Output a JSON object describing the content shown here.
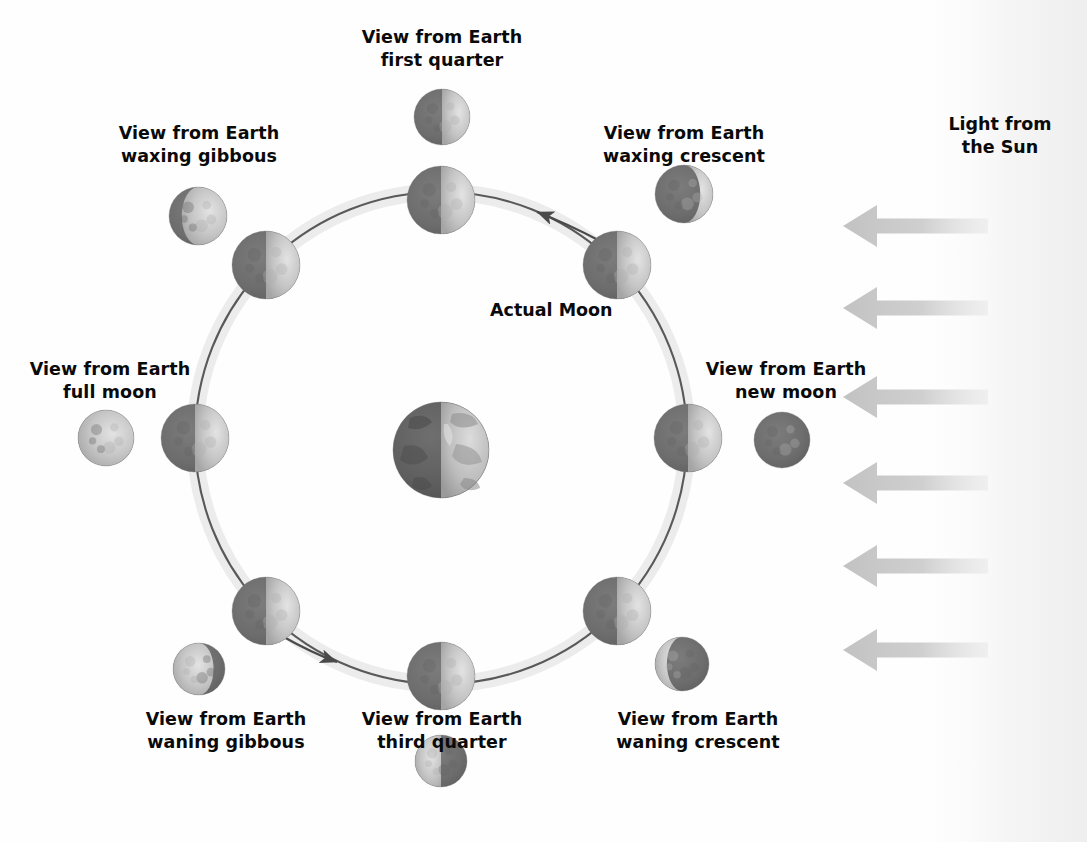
{
  "diagram": {
    "background_color": "#fefefe",
    "text_color": "#0a0a0a",
    "orbit_band_color": "#ebebeb",
    "orbit_line_color": "#4a4a4a",
    "sun_arrow_color": "#c9c9c9",
    "sun_glow_color": "#f1f1f1",
    "moon_lit_color": "#c8c8c8",
    "moon_dark_color": "#6e6e6e",
    "earth_lit_color": "#c4c4c4",
    "earth_dark_color": "#5f5f5f"
  },
  "center_label": {
    "actual_moon": "Actual Moon"
  },
  "sun": {
    "label": "Light from\nthe Sun",
    "direction": "right-to-left",
    "arrow_count": 6,
    "arrows": [
      {
        "y": 226,
        "tip_x": 843,
        "tail_x": 988
      },
      {
        "y": 308,
        "tip_x": 843,
        "tail_x": 988
      },
      {
        "y": 397,
        "tip_x": 843,
        "tail_x": 988
      },
      {
        "y": 483,
        "tip_x": 843,
        "tail_x": 988
      },
      {
        "y": 566,
        "tip_x": 843,
        "tail_x": 988
      },
      {
        "y": 650,
        "tip_x": 843,
        "tail_x": 988
      }
    ]
  },
  "orbit": {
    "center_x": 441,
    "center_y": 438,
    "radius": 246,
    "direction": "counterclockwise",
    "band_width": 16
  },
  "earth": {
    "name": "Earth",
    "cx": 441,
    "cy": 450,
    "r": 48,
    "lit_side": "right"
  },
  "phases": [
    {
      "key": "first-quarter",
      "label": "View from Earth\nfirst quarter",
      "orbit_angle_deg": 90,
      "orbit_moon": {
        "cx": 441,
        "cy": 200,
        "r": 34,
        "lit_side": "right",
        "lit_fraction": 0.5
      },
      "view_moon": {
        "cx": 442,
        "cy": 117,
        "r": 28,
        "phase": "first-quarter",
        "lit_fraction": 0.5,
        "lit_side": "right"
      },
      "label_box": {
        "left": 330,
        "top": 26,
        "width": 224
      }
    },
    {
      "key": "waxing-crescent",
      "label": "View from Earth\nwaxing crescent",
      "orbit_angle_deg": 45,
      "orbit_moon": {
        "cx": 617,
        "cy": 265,
        "r": 34,
        "lit_side": "right",
        "lit_fraction": 0.5
      },
      "view_moon": {
        "cx": 684,
        "cy": 194,
        "r": 29,
        "phase": "waxing-crescent",
        "lit_fraction": 0.22,
        "lit_side": "right"
      },
      "label_box": {
        "left": 572,
        "top": 122,
        "width": 224
      }
    },
    {
      "key": "waxing-gibbous",
      "label": "View from Earth\nwaxing gibbous",
      "orbit_angle_deg": 135,
      "orbit_moon": {
        "cx": 266,
        "cy": 265,
        "r": 34,
        "lit_side": "right",
        "lit_fraction": 0.5
      },
      "view_moon": {
        "cx": 198,
        "cy": 216,
        "r": 29,
        "phase": "waxing-gibbous",
        "lit_fraction": 0.78,
        "lit_side": "right"
      },
      "label_box": {
        "left": 87,
        "top": 122,
        "width": 224
      }
    },
    {
      "key": "full-moon",
      "label": "View from Earth\nfull moon",
      "orbit_angle_deg": 180,
      "orbit_moon": {
        "cx": 195,
        "cy": 438,
        "r": 34,
        "lit_side": "right",
        "lit_fraction": 0.5
      },
      "view_moon": {
        "cx": 106,
        "cy": 438,
        "r": 28,
        "phase": "full-moon",
        "lit_fraction": 1.0,
        "lit_side": "right"
      },
      "label_box": {
        "left": 20,
        "top": 358,
        "width": 180
      }
    },
    {
      "key": "new-moon",
      "label": "View from Earth\nnew moon",
      "orbit_angle_deg": 0,
      "orbit_moon": {
        "cx": 688,
        "cy": 438,
        "r": 34,
        "lit_side": "right",
        "lit_fraction": 0.5
      },
      "view_moon": {
        "cx": 782,
        "cy": 440,
        "r": 28,
        "phase": "new-moon",
        "lit_fraction": 0.0,
        "lit_side": "right"
      },
      "label_box": {
        "left": 692,
        "top": 358,
        "width": 188
      }
    },
    {
      "key": "waning-gibbous",
      "label": "View from Earth\nwaning gibbous",
      "orbit_angle_deg": 225,
      "orbit_moon": {
        "cx": 266,
        "cy": 611,
        "r": 34,
        "lit_side": "right",
        "lit_fraction": 0.5
      },
      "view_moon": {
        "cx": 199,
        "cy": 669,
        "r": 26,
        "phase": "waning-gibbous",
        "lit_fraction": 0.78,
        "lit_side": "left"
      },
      "label_box": {
        "left": 114,
        "top": 708,
        "width": 224
      }
    },
    {
      "key": "waning-crescent",
      "label": "View from Earth\nwaning crescent",
      "orbit_angle_deg": 315,
      "orbit_moon": {
        "cx": 617,
        "cy": 611,
        "r": 34,
        "lit_side": "right",
        "lit_fraction": 0.5
      },
      "view_moon": {
        "cx": 682,
        "cy": 664,
        "r": 27,
        "phase": "waning-crescent",
        "lit_fraction": 0.22,
        "lit_side": "left"
      },
      "label_box": {
        "left": 586,
        "top": 708,
        "width": 224
      }
    },
    {
      "key": "third-quarter",
      "label": "View from Earth\nthird quarter",
      "orbit_angle_deg": 270,
      "orbit_moon": {
        "cx": 441,
        "cy": 676,
        "r": 34,
        "lit_side": "right",
        "lit_fraction": 0.5
      },
      "view_moon": {
        "cx": 441,
        "cy": 761,
        "r": 26,
        "phase": "third-quarter",
        "lit_fraction": 0.5,
        "lit_side": "left"
      },
      "label_box": {
        "left": 330,
        "top": 708,
        "width": 224
      }
    }
  ],
  "orbit_arrows": [
    {
      "key": "upper-right-arrow",
      "from_x": 596,
      "from_y": 237,
      "to_x": 534,
      "to_y": 211,
      "points": "counterclockwise"
    },
    {
      "key": "lower-left-arrow",
      "from_x": 285,
      "from_y": 638,
      "to_x": 340,
      "to_y": 663,
      "points": "counterclockwise"
    }
  ]
}
